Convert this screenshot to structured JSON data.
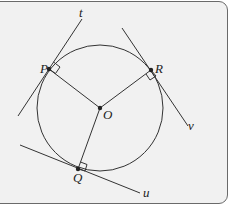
{
  "diagram": {
    "points": {
      "O": {
        "label": "O",
        "x": 100,
        "y": 108
      },
      "P": {
        "label": "P",
        "x": 49,
        "y": 69
      },
      "R": {
        "label": "R",
        "x": 151,
        "y": 70
      },
      "Q": {
        "label": "Q",
        "x": 78,
        "y": 169
      }
    },
    "tangents": {
      "t": {
        "label": "t"
      },
      "v": {
        "label": "v"
      },
      "u": {
        "label": "u"
      }
    },
    "colors": {
      "line": "#222222",
      "background": "#f1f1f1",
      "border": "#6a6a6a"
    }
  }
}
